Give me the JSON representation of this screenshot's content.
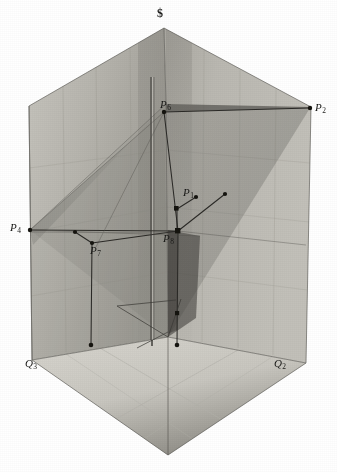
{
  "figure": {
    "caption": "",
    "background_color": "#ffffff",
    "ink_color": "#1a1a18",
    "box": {
      "description": "three-dimensional corner box (two walls and a floor) drawn in isometric-style projection, rendered as a halftone photograph of a physical model",
      "top_apex": {
        "x": 164,
        "y": 28
      },
      "left_corner": {
        "x": 29,
        "y": 106
      },
      "right_corner": {
        "x": 311,
        "y": 107
      },
      "center_vertical_top": {
        "x": 166,
        "y": 104
      },
      "left_bottom": {
        "x": 32,
        "y": 360
      },
      "right_bottom": {
        "x": 306,
        "y": 363
      },
      "center_floor": {
        "x": 168,
        "y": 337
      },
      "bottom_apex": {
        "x": 168,
        "y": 455
      },
      "wall_tone_left": "#b9b7b0",
      "wall_tone_right": "#aeaca6",
      "wall_tone_shadow": "#8d8b85",
      "floor_tone": "#cdcbc4"
    }
  },
  "labels": [
    {
      "name": "apex-symbol",
      "text": "$",
      "x": 157,
      "y": 7,
      "kind": "symbol"
    },
    {
      "name": "point-p6",
      "text": "P",
      "sub": "6",
      "x": 160,
      "y": 99,
      "kind": "point"
    },
    {
      "name": "point-p2",
      "text": "P",
      "sub": "2",
      "x": 315,
      "y": 102,
      "kind": "point"
    },
    {
      "name": "point-p1",
      "text": "P",
      "sub": "1",
      "x": 183,
      "y": 187,
      "kind": "point"
    },
    {
      "name": "point-p4",
      "text": "P",
      "sub": "4",
      "x": 10,
      "y": 222,
      "kind": "point"
    },
    {
      "name": "point-p8",
      "text": "P",
      "sub": "8",
      "x": 163,
      "y": 233,
      "kind": "point"
    },
    {
      "name": "point-p7",
      "text": "P",
      "sub": "7",
      "x": 90,
      "y": 245,
      "kind": "point"
    },
    {
      "name": "point-q3",
      "text": "Q",
      "sub": "3",
      "x": 25,
      "y": 358,
      "kind": "point"
    },
    {
      "name": "point-q2",
      "text": "Q",
      "sub": "2",
      "x": 274,
      "y": 358,
      "kind": "point"
    }
  ],
  "model_points": [
    {
      "name": "node-p6",
      "x": 164,
      "y": 112,
      "r": 2.2
    },
    {
      "name": "node-p2",
      "x": 310,
      "y": 108,
      "r": 2.2
    },
    {
      "name": "node-p4",
      "x": 30,
      "y": 230,
      "r": 2.2
    },
    {
      "name": "node-p1",
      "x": 196,
      "y": 197,
      "r": 2.2
    },
    {
      "name": "node-p1-stem",
      "x": 177,
      "y": 209,
      "r": 2.4
    },
    {
      "name": "node-right-upper",
      "x": 225,
      "y": 194,
      "r": 2.2
    },
    {
      "name": "node-p8",
      "x": 178,
      "y": 231,
      "r": 2.6
    },
    {
      "name": "node-p7-left",
      "x": 75,
      "y": 232,
      "r": 2.2
    },
    {
      "name": "node-p7",
      "x": 92,
      "y": 243,
      "r": 2.2
    },
    {
      "name": "node-floor-left",
      "x": 91,
      "y": 345,
      "r": 2.4
    },
    {
      "name": "node-floor-right",
      "x": 177,
      "y": 345,
      "r": 2.4
    },
    {
      "name": "node-mid-right",
      "x": 177,
      "y": 313,
      "r": 2.2
    }
  ],
  "model_lines": [
    {
      "name": "line-p6-p2",
      "x1": 164,
      "y1": 112,
      "x2": 310,
      "y2": 108
    },
    {
      "name": "line-p6-p8",
      "x1": 164,
      "y1": 112,
      "x2": 178,
      "y2": 231
    },
    {
      "name": "line-p4-p8",
      "x1": 30,
      "y1": 230,
      "x2": 178,
      "y2": 231
    },
    {
      "name": "line-p4-p6-ray",
      "x1": 30,
      "y1": 230,
      "x2": 164,
      "y2": 112
    },
    {
      "name": "line-p1-stem",
      "x1": 177,
      "y1": 209,
      "x2": 196,
      "y2": 197
    },
    {
      "name": "line-p8-right",
      "x1": 178,
      "y1": 231,
      "x2": 225,
      "y2": 194
    },
    {
      "name": "line-p7-left",
      "x1": 75,
      "y1": 232,
      "x2": 92,
      "y2": 243
    },
    {
      "name": "line-p7-p8",
      "x1": 92,
      "y1": 243,
      "x2": 178,
      "y2": 231
    },
    {
      "name": "rod-p7-floor",
      "x1": 92,
      "y1": 243,
      "x2": 91,
      "y2": 345
    },
    {
      "name": "rod-p8-floor",
      "x1": 178,
      "y1": 231,
      "x2": 177,
      "y2": 345
    },
    {
      "name": "rod-p1-down",
      "x1": 177,
      "y1": 209,
      "x2": 177,
      "y2": 231
    },
    {
      "name": "floor-diag-left",
      "x1": 117,
      "y1": 306,
      "x2": 168,
      "y2": 337
    },
    {
      "name": "floor-diag-right",
      "x1": 168,
      "y1": 337,
      "x2": 180,
      "y2": 300
    },
    {
      "name": "center-rod",
      "x1": 152,
      "y1": 77,
      "x2": 152,
      "y2": 340
    }
  ],
  "grid": {
    "description": "faint ruled squares on both walls and on the floor of the model box",
    "wall_line_color": "#9a988f",
    "floor_line_color": "#b3b1aa"
  }
}
